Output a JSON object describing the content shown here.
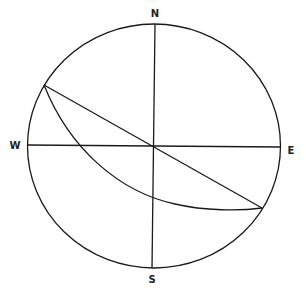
{
  "diagram": {
    "type": "stereonet",
    "labels": {
      "north": "N",
      "south": "S",
      "west": "W",
      "east": "E"
    },
    "primitive_circle": {
      "cx": 154,
      "cy": 146,
      "rx": 126.5,
      "ry": 122
    },
    "strike_line": {
      "from": [
        44,
        85
      ],
      "to": [
        262,
        208
      ]
    },
    "great_circle_arc": {
      "from": [
        44,
        85
      ],
      "to": [
        262,
        208
      ],
      "crosses_ew_at_x": 79,
      "crosses_ns_at_y": 197
    },
    "colors": {
      "line": "#1a1a1a",
      "background": "#ffffff"
    }
  }
}
